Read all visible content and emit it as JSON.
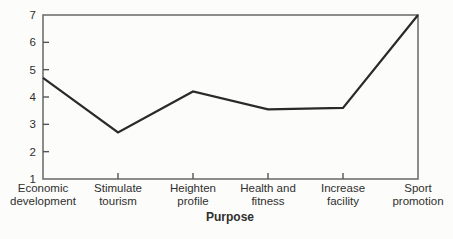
{
  "chart_data": {
    "type": "line",
    "title": "",
    "xlabel": "Purpose",
    "ylabel": "",
    "categories": [
      "Economic\ndevelopment",
      "Stimulate\ntourism",
      "Heighten\nprofile",
      "Health and\nfitness",
      "Increase\nfacility",
      "Sport\npromotion"
    ],
    "values": [
      4.7,
      2.7,
      4.2,
      3.55,
      3.6,
      7.0
    ],
    "ylim": [
      1,
      7
    ],
    "yticks": [
      1,
      2,
      3,
      4,
      5,
      6,
      7
    ],
    "grid": "off",
    "legend": "none",
    "frame": "box",
    "tick_direction": "in",
    "colors": {
      "line": "#2a2a2a",
      "frame": "#707070",
      "tick": "#555555",
      "text": "#2f2f2f",
      "background": "#fcfcfa"
    }
  }
}
